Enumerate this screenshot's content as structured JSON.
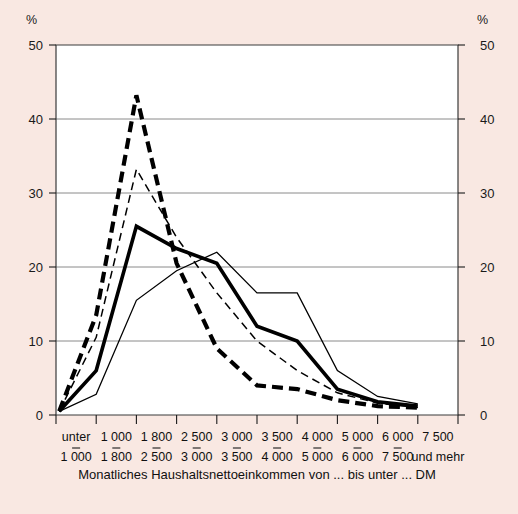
{
  "chart_data": {
    "type": "line",
    "title": "",
    "xlabel": "Monatliches Haushaltsnettoeinkommen von ... bis unter ... DM",
    "ylabel": "%",
    "ylim": [
      0,
      50
    ],
    "yticks": [
      0,
      10,
      20,
      30,
      40,
      50
    ],
    "ytick_labels": [
      "0",
      "10",
      "20",
      "30",
      "40",
      "50"
    ],
    "y_unit_label": "%",
    "grid": true,
    "gridlines_at": [
      10,
      20,
      30,
      40
    ],
    "legend_position": "none",
    "dual_y_axis": true,
    "categories": [
      "unter 1 000",
      "1 000 - 1 800",
      "1 800 - 2 500",
      "2 500 - 3 000",
      "3 000 - 3 500",
      "3 500 - 4 000",
      "4 000 - 5 000",
      "5 000 - 6 000",
      "6 000 - 7 500",
      "7 500 und mehr"
    ],
    "category_lines": [
      {
        "top": "unter",
        "bottom": "1 000"
      },
      {
        "top": "1 000",
        "bottom": "1 800"
      },
      {
        "top": "1 800",
        "bottom": "2 500"
      },
      {
        "top": "2 500",
        "bottom": "3 000"
      },
      {
        "top": "3 000",
        "bottom": "3 500"
      },
      {
        "top": "3 500",
        "bottom": "4 000"
      },
      {
        "top": "4 000",
        "bottom": "5 000"
      },
      {
        "top": "5 000",
        "bottom": "6 000"
      },
      {
        "top": "6 000",
        "bottom": "7 500"
      },
      {
        "top": "7 500",
        "bottom": "und mehr"
      }
    ],
    "series": [
      {
        "name": "thick-dashed",
        "style": "thick dashed",
        "values": [
          0.5,
          13.5,
          43.2,
          20.5,
          9.0,
          4.0,
          3.5,
          2.0,
          1.2,
          1.0
        ]
      },
      {
        "name": "thin-dashed",
        "style": "thin dashed",
        "values": [
          0.5,
          10.5,
          33.2,
          24.0,
          16.5,
          10.0,
          6.0,
          3.0,
          1.6,
          1.0
        ]
      },
      {
        "name": "thick-solid",
        "style": "thick solid",
        "values": [
          0.5,
          6.0,
          25.5,
          22.5,
          20.5,
          12.0,
          10.0,
          3.5,
          1.8,
          1.2
        ]
      },
      {
        "name": "thin-solid",
        "style": "thin solid",
        "values": [
          0.5,
          2.8,
          15.5,
          19.5,
          22.0,
          16.5,
          16.5,
          6.0,
          2.5,
          1.5
        ]
      }
    ]
  },
  "axis": {
    "unit_left": "%",
    "unit_right": "%"
  },
  "caption": {
    "text": "Monatliches Haushaltsnettoeinkommen von ... bis unter ... DM"
  }
}
